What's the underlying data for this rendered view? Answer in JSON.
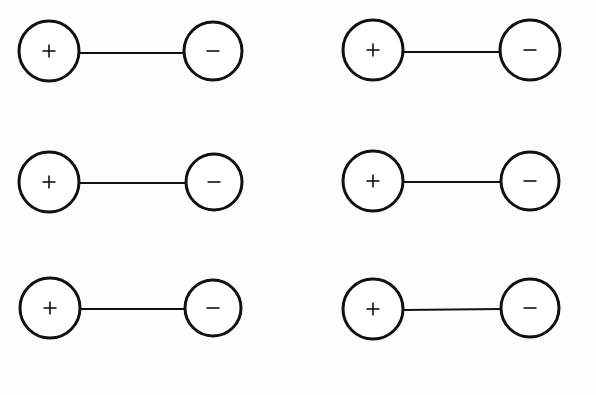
{
  "figure": {
    "background_color": "#fdfdfd",
    "ink_color": "#111111",
    "fill_color": "#ffffff",
    "canvas": {
      "width": 596,
      "height": 395
    },
    "layout": {
      "type": "grid",
      "columns": 2,
      "rows": 3,
      "total_dipoles": 6
    },
    "style": {
      "circle_stroke_width": 3,
      "bond_stroke_width": 2,
      "glyph_stroke_width": 1.6
    },
    "symbols": {
      "positive": "+",
      "negative": "−"
    },
    "dipoles": [
      {
        "id": "dipole-r1c1",
        "row": 1,
        "column": 1,
        "positive": {
          "label": "+",
          "cx": 49,
          "cy": 51,
          "r": 30
        },
        "negative": {
          "label": "−",
          "cx": 213,
          "cy": 51,
          "r": 29
        },
        "bond": {
          "x1": 79,
          "y1": 53,
          "x2": 184,
          "y2": 53
        }
      },
      {
        "id": "dipole-r1c2",
        "row": 1,
        "column": 2,
        "positive": {
          "label": "+",
          "cx": 373,
          "cy": 50,
          "r": 30
        },
        "negative": {
          "label": "−",
          "cx": 530,
          "cy": 50,
          "r": 30
        },
        "bond": {
          "x1": 403,
          "y1": 52,
          "x2": 500,
          "y2": 52
        }
      },
      {
        "id": "dipole-r2c1",
        "row": 2,
        "column": 1,
        "positive": {
          "label": "+",
          "cx": 49,
          "cy": 182,
          "r": 30
        },
        "negative": {
          "label": "−",
          "cx": 214,
          "cy": 182,
          "r": 28
        },
        "bond": {
          "x1": 79,
          "y1": 183,
          "x2": 186,
          "y2": 183
        }
      },
      {
        "id": "dipole-r2c2",
        "row": 2,
        "column": 2,
        "positive": {
          "label": "+",
          "cx": 373,
          "cy": 181,
          "r": 30
        },
        "negative": {
          "label": "−",
          "cx": 530,
          "cy": 181,
          "r": 29
        },
        "bond": {
          "x1": 403,
          "y1": 182,
          "x2": 501,
          "y2": 182
        }
      },
      {
        "id": "dipole-r3c1",
        "row": 3,
        "column": 1,
        "positive": {
          "label": "+",
          "cx": 50,
          "cy": 308,
          "r": 30
        },
        "negative": {
          "label": "−",
          "cx": 213,
          "cy": 308,
          "r": 28
        },
        "bond": {
          "x1": 80,
          "y1": 309,
          "x2": 185,
          "y2": 309
        }
      },
      {
        "id": "dipole-r3c2",
        "row": 3,
        "column": 2,
        "positive": {
          "label": "+",
          "cx": 373,
          "cy": 309,
          "r": 30
        },
        "negative": {
          "label": "−",
          "cx": 530,
          "cy": 308,
          "r": 29
        },
        "bond": {
          "x1": 403,
          "y1": 310,
          "x2": 501,
          "y2": 309
        }
      }
    ]
  }
}
